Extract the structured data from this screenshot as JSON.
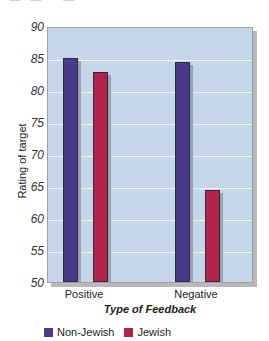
{
  "top_cutoff_text": "~ — · — ~ ~ — ~",
  "chart_data": {
    "type": "bar",
    "title": "",
    "xlabel": "Type of Feedback",
    "ylabel": "Rating of target",
    "categories": [
      "Positive",
      "Negative"
    ],
    "series": [
      {
        "name": "Non-Jewish",
        "color": "#4a3a8c",
        "values": [
          85.0,
          84.3
        ]
      },
      {
        "name": "Jewish",
        "color": "#b3234a",
        "values": [
          82.8,
          64.3
        ]
      }
    ],
    "ylim": [
      50,
      90
    ],
    "yticks": [
      "90",
      "85",
      "80",
      "75",
      "70",
      "65",
      "60",
      "55",
      "50"
    ],
    "grid": true,
    "legend_position": "bottom-left"
  }
}
